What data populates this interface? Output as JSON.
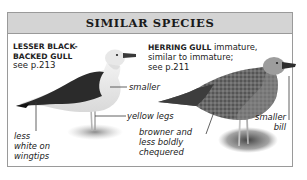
{
  "header": {
    "title": "SIMILAR SPECIES"
  },
  "species": [
    {
      "name_line1": "LESSER BLACK-",
      "name_line2": "BACKED GULL",
      "ref": "see p.213",
      "notes": {
        "smaller": "smaller",
        "legs": "yellow legs",
        "wingtips_1": "less",
        "wingtips_2": "white on",
        "wingtips_3": "wingtips"
      }
    },
    {
      "name": "HERRING GULL",
      "desc_1": " immature,",
      "desc_2": "similar to immature;",
      "ref": "see p.211",
      "notes": {
        "plumage_1": "browner and",
        "plumage_2": "less boldly",
        "plumage_3": "chequered",
        "bill_1": "smaller",
        "bill_2": "bill"
      }
    }
  ]
}
